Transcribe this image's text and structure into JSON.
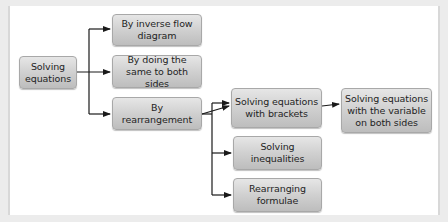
{
  "diagram": {
    "root": {
      "label": "Solving equations"
    },
    "methods": [
      {
        "label": "By inverse flow diagram"
      },
      {
        "label": "By doing the same to both sides"
      },
      {
        "label": "By rearrangement"
      }
    ],
    "rearrangement_children": [
      {
        "label": "Solving equations with brackets"
      },
      {
        "label": "Solving inequalities"
      },
      {
        "label": "Rearranging formulae"
      }
    ],
    "brackets_child": {
      "label": "Solving equations with the variable on both sides"
    },
    "colors": {
      "node_top": "#e6e6e6",
      "node_bottom": "#bdbdbd",
      "line": "#1a1a1a",
      "background": "#ffffff"
    }
  }
}
